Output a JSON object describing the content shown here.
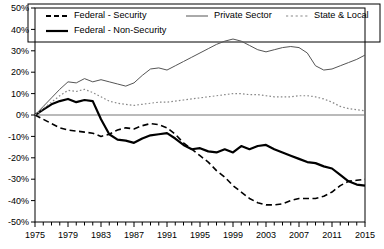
{
  "chart_data": {
    "type": "line",
    "title": "",
    "subtitle": "",
    "xlabel": "",
    "ylabel": "",
    "xlim": [
      1975,
      2015
    ],
    "ylim": [
      -50,
      50
    ],
    "grid": false,
    "legend_position": "top",
    "y_ticks": [
      "50%",
      "40%",
      "30%",
      "20%",
      "10%",
      "0%",
      "-10%",
      "-20%",
      "-30%",
      "-40%",
      "-50%"
    ],
    "y_tick_values": [
      50,
      40,
      30,
      20,
      10,
      0,
      -10,
      -20,
      -30,
      -40,
      -50
    ],
    "x_ticks": [
      "1975",
      "1979",
      "1983",
      "1987",
      "1991",
      "1995",
      "1999",
      "2003",
      "2007",
      "2011",
      "2015"
    ],
    "x_tick_values": [
      1975,
      1979,
      1983,
      1987,
      1991,
      1995,
      1999,
      2003,
      2007,
      2011,
      2015
    ],
    "x_minor_tick_step": 1,
    "zero_line": 0,
    "x": [
      1975,
      1976,
      1977,
      1978,
      1979,
      1980,
      1981,
      1982,
      1983,
      1984,
      1985,
      1986,
      1987,
      1988,
      1989,
      1990,
      1991,
      1992,
      1993,
      1994,
      1995,
      1996,
      1997,
      1998,
      1999,
      2000,
      2001,
      2002,
      2003,
      2004,
      2005,
      2006,
      2007,
      2008,
      2009,
      2010,
      2011,
      2012,
      2013,
      2014,
      2015
    ],
    "series": [
      {
        "name": "Federal - Security",
        "style": "dashed",
        "color": "#000000",
        "width": 1.6,
        "values": [
          0,
          -2,
          -4,
          -6,
          -7,
          -7.5,
          -8,
          -8.5,
          -10,
          -9,
          -7,
          -6,
          -6.5,
          -5,
          -4,
          -4.5,
          -6,
          -9,
          -13,
          -16,
          -19,
          -22,
          -26,
          -29,
          -33,
          -36,
          -39,
          -41,
          -42,
          -42,
          -41.5,
          -40,
          -39,
          -39,
          -39,
          -38,
          -36,
          -33,
          -31,
          -30.5,
          -30
        ]
      },
      {
        "name": "Federal - Non-Security",
        "style": "solid",
        "color": "#000000",
        "width": 2.2,
        "values": [
          0,
          2.5,
          5,
          6.5,
          7.5,
          6,
          7,
          6.5,
          -2,
          -9,
          -11.5,
          -12,
          -13,
          -11,
          -9.5,
          -9,
          -8.5,
          -11,
          -14,
          -16,
          -15.5,
          -17,
          -17.5,
          -16,
          -17.5,
          -14.5,
          -16,
          -14.5,
          -14,
          -16,
          -17.5,
          -19,
          -20.5,
          -22,
          -22.5,
          -24,
          -25,
          -28,
          -31,
          -32.5,
          -33
        ]
      },
      {
        "name": "Private Sector",
        "style": "solid",
        "color": "#555555",
        "width": 1.0,
        "values": [
          0,
          4,
          8,
          12,
          15.5,
          15,
          17,
          15.5,
          16.5,
          15.5,
          14.5,
          13.5,
          15,
          18.5,
          21.5,
          22,
          21,
          23,
          25,
          27,
          29,
          31,
          33,
          34.5,
          35.5,
          34.5,
          32.5,
          30.5,
          29.5,
          30.5,
          31.5,
          32,
          31.5,
          29,
          23,
          21,
          21.5,
          23,
          24.5,
          26,
          28
        ]
      },
      {
        "name": "State & Local",
        "style": "dotted",
        "color": "#888888",
        "width": 1.2,
        "values": [
          0,
          3,
          6,
          9,
          11.5,
          11,
          12,
          10.5,
          8.5,
          6.5,
          5.5,
          5,
          4.5,
          5,
          5.5,
          6,
          6,
          6.5,
          7,
          7.5,
          8,
          8.5,
          9,
          9.5,
          10,
          10,
          9.5,
          9.5,
          9,
          8.5,
          8.5,
          8.5,
          9,
          9,
          8.5,
          7.5,
          6,
          4,
          3,
          2.5,
          2
        ]
      }
    ]
  },
  "legend": {
    "entries": [
      {
        "label": "Federal - Security",
        "style": "dashed",
        "color": "#000000"
      },
      {
        "label": "Private Sector",
        "style": "solid",
        "color": "#555555"
      },
      {
        "label": "State & Local",
        "style": "dotted",
        "color": "#888888"
      },
      {
        "label": "Federal - Non-Security",
        "style": "solid",
        "color": "#000000"
      }
    ]
  },
  "colors": {
    "axis": "#000000",
    "frame": "#000000",
    "background": "#ffffff",
    "zero_line": "#777777"
  }
}
